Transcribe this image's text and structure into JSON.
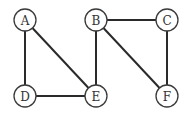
{
  "graph": {
    "nodes": [
      {
        "id": "A",
        "label": "A",
        "x": 25,
        "y": 20
      },
      {
        "id": "B",
        "label": "B",
        "x": 96,
        "y": 20
      },
      {
        "id": "C",
        "label": "C",
        "x": 167,
        "y": 20
      },
      {
        "id": "D",
        "label": "D",
        "x": 25,
        "y": 96
      },
      {
        "id": "E",
        "label": "E",
        "x": 96,
        "y": 96
      },
      {
        "id": "F",
        "label": "F",
        "x": 167,
        "y": 96
      }
    ],
    "edges": [
      {
        "from": "A",
        "to": "D"
      },
      {
        "from": "A",
        "to": "E"
      },
      {
        "from": "D",
        "to": "E"
      },
      {
        "from": "B",
        "to": "E"
      },
      {
        "from": "B",
        "to": "C"
      },
      {
        "from": "B",
        "to": "F"
      },
      {
        "from": "C",
        "to": "F"
      }
    ],
    "node_radius": 11
  }
}
